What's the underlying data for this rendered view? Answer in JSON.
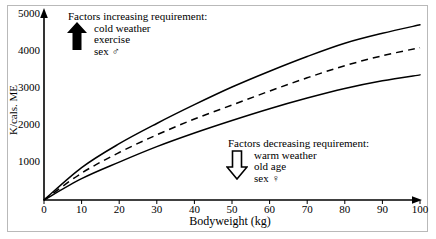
{
  "chart_data": {
    "type": "line",
    "title": "",
    "xlabel": "Bodyweight (kg)",
    "ylabel": "K/cals. ME",
    "xlim": [
      0,
      100
    ],
    "ylim": [
      0,
      5000
    ],
    "xticks": [
      "0",
      "10",
      "20",
      "30",
      "40",
      "50",
      "60",
      "70",
      "80",
      "90",
      "100"
    ],
    "yticks": [
      "1000",
      "2000",
      "3000",
      "4000",
      "5000"
    ],
    "grid": false,
    "legend_position": "none",
    "x": [
      0,
      10,
      20,
      30,
      40,
      50,
      60,
      70,
      80,
      90,
      100
    ],
    "series": [
      {
        "name": "upper bound",
        "style": "solid",
        "values": [
          0,
          880,
          1530,
          2080,
          2590,
          3070,
          3500,
          3900,
          4260,
          4530,
          4760
        ]
      },
      {
        "name": "mean requirement",
        "style": "dashed",
        "values": [
          0,
          730,
          1290,
          1770,
          2200,
          2580,
          2960,
          3320,
          3650,
          3920,
          4140
        ]
      },
      {
        "name": "lower bound",
        "style": "solid",
        "values": [
          0,
          580,
          1030,
          1450,
          1820,
          2160,
          2480,
          2770,
          3030,
          3240,
          3400
        ]
      }
    ],
    "annotations": [
      {
        "id": "increasing",
        "heading": "Factors increasing requirement:",
        "items": [
          "cold weather",
          "exercise",
          "sex ♂"
        ],
        "arrow": "arrow-up-solid"
      },
      {
        "id": "decreasing",
        "heading": "Factors decreasing requirement:",
        "items": [
          "warm weather",
          "old age",
          "sex ♀"
        ],
        "arrow": "arrow-down-outline"
      }
    ]
  },
  "axes": {
    "y_label": "K/cals. ME",
    "x_label": "Bodyweight (kg)",
    "y_ticks": [
      "5000",
      "4000",
      "3000",
      "2000",
      "1000"
    ],
    "x_ticks": [
      "0",
      "10",
      "20",
      "30",
      "40",
      "50",
      "60",
      "70",
      "80",
      "90",
      "100"
    ]
  },
  "annotation_increasing": {
    "heading": "Factors increasing requirement:",
    "line1": "cold weather",
    "line2": "exercise",
    "line3": "sex ♂"
  },
  "annotation_decreasing": {
    "heading": "Factors decreasing requirement:",
    "line1": "warm weather",
    "line2": "old age",
    "line3": "sex ♀"
  },
  "colors": {
    "ink": "#000000",
    "frame": "#b9b9b9",
    "background": "#ffffff"
  }
}
